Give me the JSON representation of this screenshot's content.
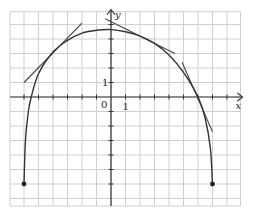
{
  "chart_data": {
    "type": "line",
    "title": "",
    "xlabel": "x",
    "ylabel": "y",
    "origin_label": "0",
    "x_tick_label": "1",
    "y_tick_label": "1",
    "xlim": [
      -7,
      9
    ],
    "ylim": [
      -7,
      6
    ],
    "grid": true,
    "curve": {
      "description": "concave-down curve with vertical endpoints at (-6,-6) and (7,-6), maximum near (0,4.6), x-intercepts near -5.5 and 6",
      "points": [
        [
          -6,
          -6
        ],
        [
          -5.9,
          -3
        ],
        [
          -5.7,
          -1
        ],
        [
          -5.5,
          0
        ],
        [
          -5,
          1.6
        ],
        [
          -4,
          3.1
        ],
        [
          -3,
          3.9
        ],
        [
          -2,
          4.4
        ],
        [
          -1,
          4.6
        ],
        [
          0,
          4.65
        ],
        [
          1,
          4.5
        ],
        [
          2,
          4.2
        ],
        [
          3,
          3.7
        ],
        [
          4,
          2.9
        ],
        [
          5,
          1.7
        ],
        [
          6,
          0
        ],
        [
          6.5,
          -1.5
        ],
        [
          6.85,
          -3.5
        ],
        [
          7,
          -6
        ]
      ],
      "endpoints": [
        [
          -6,
          -6
        ],
        [
          7,
          -6
        ]
      ]
    },
    "tangent_lines": [
      {
        "touch_point": [
          -4,
          3.1
        ],
        "from": [
          -6,
          1
        ],
        "to": [
          -2,
          5.1
        ]
      },
      {
        "touch_point": [
          2,
          4.3
        ],
        "from": [
          -0.4,
          5.4
        ],
        "to": [
          4.4,
          3.0
        ]
      },
      {
        "touch_point": [
          6,
          0
        ],
        "from": [
          4.9,
          2.4
        ],
        "to": [
          7.0,
          -2.4
        ]
      }
    ],
    "axis_color": "#333333",
    "grid_color": "#cfcfcf",
    "curve_color": "#333333"
  }
}
